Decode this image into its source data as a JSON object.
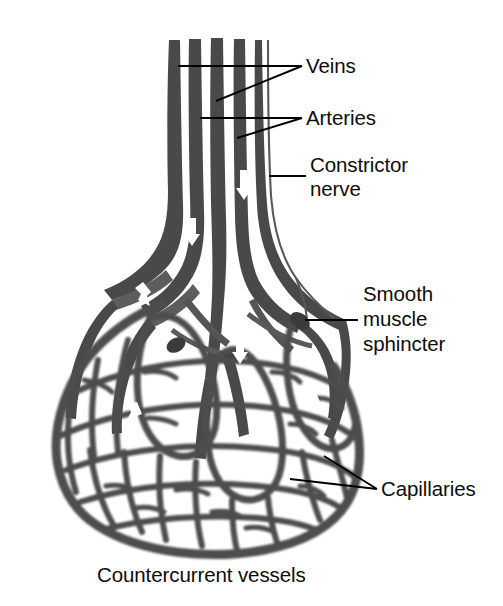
{
  "figure": {
    "title": "Countercurrent vessels",
    "caption": "Countercurrent vessels",
    "background_color": "#ffffff",
    "ink_color": "#4a4a4a",
    "text_color": "#0d0d0d",
    "width": 503,
    "height": 606
  },
  "labels": [
    {
      "id": "veins",
      "text": "Veins",
      "x": 306,
      "y": 72,
      "leaders": 2,
      "points_to": "vessel-bundle-top"
    },
    {
      "id": "arteries",
      "text": "Arteries",
      "x": 306,
      "y": 124,
      "leaders": 2,
      "points_to": "vessel-bundle-mid"
    },
    {
      "id": "constrictor-nerve",
      "text": "Constrictor",
      "text_line2": "nerve",
      "x": 310,
      "y": 171,
      "leaders": 1,
      "points_to": "nerve-line"
    },
    {
      "id": "smooth-muscle-sphincter",
      "text": "Smooth",
      "text_line2": "muscle",
      "text_line3": "sphincter",
      "x": 363,
      "y": 300,
      "leaders": 1,
      "points_to": "sphincter-band"
    },
    {
      "id": "capillaries",
      "text": "Capillaries",
      "x": 381,
      "y": 495,
      "leaders": 2,
      "points_to": "capillary-bed"
    }
  ],
  "structures": [
    {
      "id": "vessel-bundle",
      "name": "Parallel vessel bundle (veins and arteries)"
    },
    {
      "id": "nerve-line",
      "name": "Constrictor nerve fibre"
    },
    {
      "id": "sphincter-band",
      "name": "Smooth muscle sphincter constriction"
    },
    {
      "id": "capillary-bed",
      "name": "Reticulated capillary network"
    },
    {
      "id": "flow-arrows",
      "name": "Blood flow direction arrows"
    }
  ]
}
